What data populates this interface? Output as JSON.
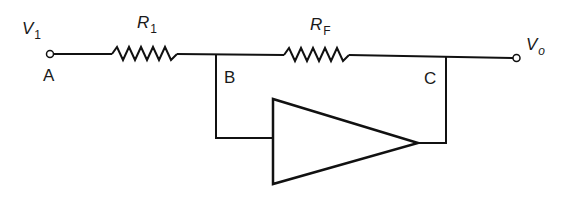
{
  "diagram": {
    "type": "inverting amplifier circuit",
    "labels": {
      "input_voltage": {
        "symbol": "V",
        "subscript": "1"
      },
      "output_voltage": {
        "symbol": "V",
        "subscript": "o"
      },
      "resistor_input": {
        "symbol": "R",
        "subscript": "1"
      },
      "resistor_feedback": {
        "symbol": "R",
        "subscript": "F"
      },
      "node_a": "A",
      "node_b": "B",
      "node_c": "C"
    },
    "colors": {
      "line": "#111111",
      "background": "#ffffff"
    }
  }
}
